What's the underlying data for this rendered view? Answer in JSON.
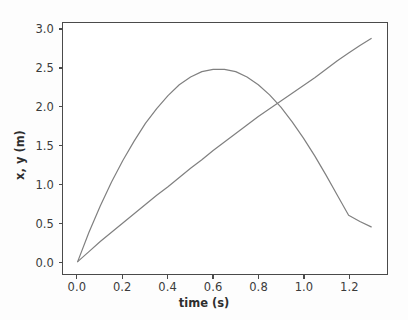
{
  "chart_data": {
    "type": "line",
    "title": "",
    "xlabel": "time (s)",
    "ylabel": "x, y (m)",
    "xlim": [
      -0.065,
      1.37
    ],
    "ylim": [
      -0.16,
      3.09
    ],
    "xticks": [
      "0.0",
      "0.2",
      "0.4",
      "0.6",
      "0.8",
      "1.0",
      "1.2"
    ],
    "xtick_values": [
      0.0,
      0.2,
      0.4,
      0.6,
      0.8,
      1.0,
      1.2
    ],
    "yticks": [
      "0.0",
      "0.5",
      "1.0",
      "1.5",
      "2.0",
      "2.5",
      "3.0"
    ],
    "ytick_values": [
      0.0,
      0.5,
      1.0,
      1.5,
      2.0,
      2.5,
      3.0
    ],
    "grid": false,
    "legend": "none",
    "line_color": "#808080",
    "line_width": 1.2,
    "axes_color": "#4a4a4a",
    "background_color": "#ffffff",
    "figure_background_color": "#fdfdfd",
    "series": [
      {
        "name": "y",
        "label": "y (m)",
        "color": "#808080",
        "x": [
          0.0,
          0.05,
          0.1,
          0.15,
          0.2,
          0.25,
          0.3,
          0.35,
          0.4,
          0.45,
          0.5,
          0.55,
          0.6,
          0.65,
          0.7,
          0.75,
          0.8,
          0.85,
          0.9,
          0.95,
          1.0,
          1.05,
          1.1,
          1.15,
          1.2,
          1.25,
          1.3
        ],
        "y": [
          0.0,
          0.38,
          0.72,
          1.03,
          1.31,
          1.56,
          1.79,
          1.98,
          2.15,
          2.29,
          2.39,
          2.46,
          2.49,
          2.49,
          2.46,
          2.39,
          2.29,
          2.16,
          2.0,
          1.81,
          1.6,
          1.37,
          1.12,
          0.86,
          0.6,
          0.52,
          0.45
        ]
      },
      {
        "name": "x",
        "label": "x (m)",
        "color": "#808080",
        "x": [
          0.0,
          0.05,
          0.1,
          0.15,
          0.2,
          0.25,
          0.3,
          0.35,
          0.4,
          0.45,
          0.5,
          0.55,
          0.6,
          0.65,
          0.7,
          0.75,
          0.8,
          0.85,
          0.9,
          0.95,
          1.0,
          1.05,
          1.1,
          1.15,
          1.2,
          1.25,
          1.3
        ],
        "y": [
          0.0,
          0.13,
          0.26,
          0.38,
          0.5,
          0.62,
          0.74,
          0.86,
          0.97,
          1.09,
          1.21,
          1.32,
          1.44,
          1.55,
          1.66,
          1.77,
          1.88,
          1.98,
          2.08,
          2.18,
          2.28,
          2.38,
          2.49,
          2.6,
          2.7,
          2.8,
          2.89
        ]
      }
    ]
  }
}
